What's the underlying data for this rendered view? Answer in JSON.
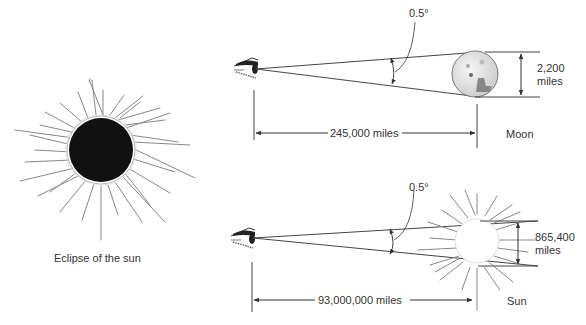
{
  "figure": {
    "eclipse_panel": {
      "caption": "Eclipse of the sun"
    },
    "moon_panel": {
      "angle_label": "0.5°",
      "distance_label": "245,000 miles",
      "diameter_value": "2,200",
      "diameter_unit": "miles",
      "object_label": "Moon"
    },
    "sun_panel": {
      "angle_label": "0.5°",
      "distance_label": "93,000,000 miles",
      "diameter_value": "865,400",
      "diameter_unit": "miles",
      "object_label": "Sun"
    }
  },
  "colors": {
    "line": "#444444",
    "ray": "#777777",
    "eclipse_disk": "#111111",
    "moon_fill": "#e4e4e4",
    "moon_shade": "#888888"
  }
}
